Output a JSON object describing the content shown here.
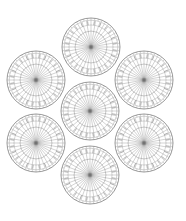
{
  "diagram": {
    "type": "strand-cross-section",
    "arrangement": "1+6 hexagonal",
    "stroke_color": "#555555",
    "spoke_color": "#6a6a6a",
    "ring_color": "#8a8a8a",
    "background": "#ffffff",
    "circle_radius": 29,
    "spokes_per_circle": 36,
    "outer_ticks_per_circle": 48,
    "circles": [
      {
        "name": "top",
        "cx": 91,
        "cy": 47
      },
      {
        "name": "upper-left",
        "cx": 36,
        "cy": 80
      },
      {
        "name": "upper-right",
        "cx": 144,
        "cy": 80
      },
      {
        "name": "center",
        "cx": 90,
        "cy": 111
      },
      {
        "name": "lower-left",
        "cx": 36,
        "cy": 143
      },
      {
        "name": "lower-right",
        "cx": 144,
        "cy": 143
      },
      {
        "name": "bottom",
        "cx": 90,
        "cy": 175
      }
    ]
  }
}
